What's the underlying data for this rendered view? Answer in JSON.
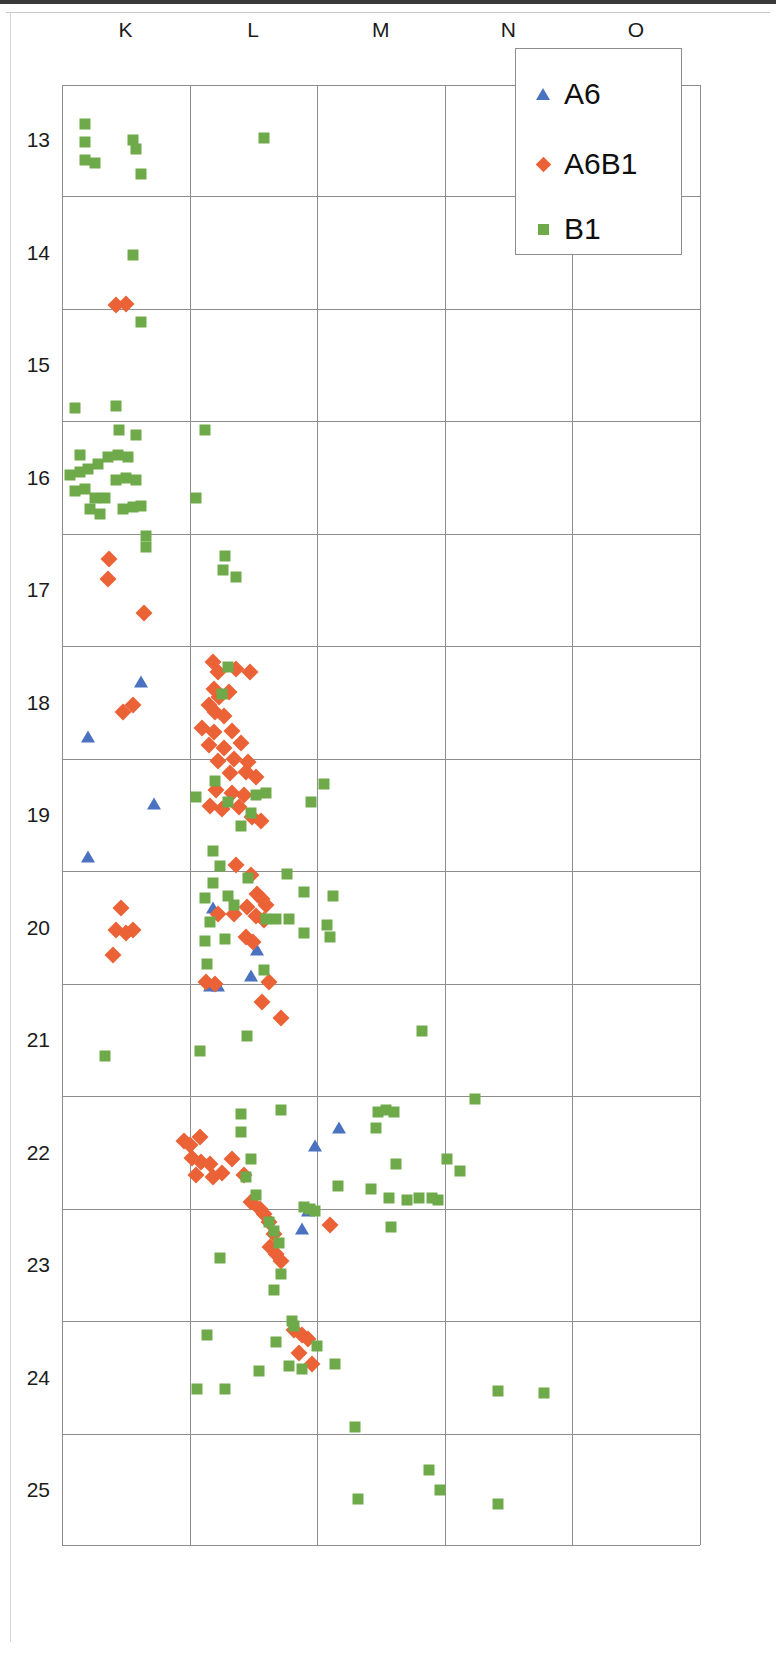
{
  "chart_data": {
    "type": "scatter",
    "title": "",
    "subtitle": "",
    "xlabel": "",
    "ylabel": "",
    "grid": true,
    "legend_position": "top-right",
    "x_tick_labels": [
      "K",
      "L",
      "M",
      "N",
      "O"
    ],
    "y_tick_labels": [
      "13",
      "14",
      "15",
      "16",
      "17",
      "18",
      "19",
      "20",
      "21",
      "22",
      "23",
      "24",
      "25"
    ],
    "y_axis_inverted": true,
    "ylim": [
      12.5,
      25.5
    ],
    "xlim": [
      0,
      5
    ],
    "legend": [
      {
        "name": "A6",
        "marker": "triangle",
        "color": "#4a72c0"
      },
      {
        "name": "A6B1",
        "marker": "diamond",
        "color": "#ec6237"
      },
      {
        "name": "B1",
        "marker": "square",
        "color": "#6faa4a"
      }
    ],
    "series": [
      {
        "name": "A6",
        "marker": "triangle",
        "color": "#4a72c0",
        "points": [
          [
            0.62,
            17.82
          ],
          [
            0.2,
            18.31
          ],
          [
            0.72,
            18.9
          ],
          [
            0.2,
            19.37
          ],
          [
            1.18,
            19.83
          ],
          [
            1.53,
            20.2
          ],
          [
            1.48,
            20.43
          ],
          [
            1.22,
            20.52
          ],
          [
            1.16,
            20.52
          ],
          [
            2.17,
            21.78
          ],
          [
            1.98,
            21.94
          ],
          [
            1.93,
            22.52
          ],
          [
            1.88,
            22.68
          ]
        ]
      },
      {
        "name": "A6B1",
        "marker": "diamond",
        "color": "#ec6237",
        "points": [
          [
            0.42,
            14.47
          ],
          [
            0.5,
            14.46
          ],
          [
            0.37,
            16.72
          ],
          [
            0.36,
            16.9
          ],
          [
            0.64,
            17.2
          ],
          [
            0.56,
            18.02
          ],
          [
            0.48,
            18.08
          ],
          [
            1.18,
            17.64
          ],
          [
            1.22,
            17.73
          ],
          [
            1.36,
            17.7
          ],
          [
            1.47,
            17.73
          ],
          [
            1.19,
            17.88
          ],
          [
            1.23,
            17.95
          ],
          [
            1.31,
            17.91
          ],
          [
            1.15,
            18.02
          ],
          [
            1.2,
            18.08
          ],
          [
            1.27,
            18.12
          ],
          [
            1.1,
            18.23
          ],
          [
            1.19,
            18.26
          ],
          [
            1.33,
            18.25
          ],
          [
            1.15,
            18.38
          ],
          [
            1.27,
            18.4
          ],
          [
            1.4,
            18.36
          ],
          [
            1.22,
            18.52
          ],
          [
            1.35,
            18.5
          ],
          [
            1.46,
            18.53
          ],
          [
            1.32,
            18.63
          ],
          [
            1.44,
            18.62
          ],
          [
            1.52,
            18.66
          ],
          [
            1.21,
            18.78
          ],
          [
            1.33,
            18.8
          ],
          [
            1.43,
            18.82
          ],
          [
            1.16,
            18.92
          ],
          [
            1.25,
            18.95
          ],
          [
            1.39,
            18.93
          ],
          [
            1.49,
            19.02
          ],
          [
            1.56,
            19.05
          ],
          [
            1.36,
            19.44
          ],
          [
            1.48,
            19.53
          ],
          [
            0.46,
            19.83
          ],
          [
            0.42,
            20.02
          ],
          [
            0.5,
            20.05
          ],
          [
            0.56,
            20.02
          ],
          [
            0.4,
            20.24
          ],
          [
            1.22,
            19.88
          ],
          [
            1.35,
            19.88
          ],
          [
            1.45,
            19.82
          ],
          [
            1.53,
            19.7
          ],
          [
            1.57,
            19.75
          ],
          [
            1.6,
            19.8
          ],
          [
            1.52,
            19.9
          ],
          [
            1.58,
            19.93
          ],
          [
            1.44,
            20.08
          ],
          [
            1.5,
            20.13
          ],
          [
            1.13,
            20.48
          ],
          [
            1.2,
            20.5
          ],
          [
            1.62,
            20.48
          ],
          [
            1.57,
            20.66
          ],
          [
            1.72,
            20.8
          ],
          [
            0.96,
            21.9
          ],
          [
            1.0,
            21.93
          ],
          [
            1.08,
            21.86
          ],
          [
            1.02,
            22.05
          ],
          [
            1.09,
            22.08
          ],
          [
            1.16,
            22.1
          ],
          [
            1.05,
            22.2
          ],
          [
            1.18,
            22.22
          ],
          [
            1.25,
            22.18
          ],
          [
            1.33,
            22.06
          ],
          [
            1.43,
            22.2
          ],
          [
            1.48,
            22.44
          ],
          [
            1.55,
            22.5
          ],
          [
            1.58,
            22.55
          ],
          [
            1.62,
            22.62
          ],
          [
            1.66,
            22.72
          ],
          [
            1.63,
            22.84
          ],
          [
            1.68,
            22.9
          ],
          [
            1.72,
            22.96
          ],
          [
            2.1,
            22.64
          ],
          [
            1.82,
            23.58
          ],
          [
            1.88,
            23.62
          ],
          [
            1.93,
            23.66
          ],
          [
            1.86,
            23.78
          ],
          [
            1.96,
            23.88
          ]
        ]
      },
      {
        "name": "B1",
        "marker": "square",
        "color": "#6faa4a",
        "points": [
          [
            0.18,
            12.86
          ],
          [
            0.18,
            13.02
          ],
          [
            0.18,
            13.18
          ],
          [
            0.26,
            13.2
          ],
          [
            0.56,
            13.0
          ],
          [
            0.58,
            13.08
          ],
          [
            0.62,
            13.3
          ],
          [
            1.58,
            12.98
          ],
          [
            0.56,
            14.02
          ],
          [
            0.62,
            14.62
          ],
          [
            0.1,
            15.38
          ],
          [
            0.42,
            15.36
          ],
          [
            0.45,
            15.58
          ],
          [
            0.58,
            15.62
          ],
          [
            1.12,
            15.58
          ],
          [
            0.14,
            15.8
          ],
          [
            0.06,
            15.98
          ],
          [
            0.14,
            15.95
          ],
          [
            0.2,
            15.92
          ],
          [
            0.28,
            15.88
          ],
          [
            0.36,
            15.82
          ],
          [
            0.44,
            15.8
          ],
          [
            0.52,
            15.82
          ],
          [
            0.1,
            16.12
          ],
          [
            0.18,
            16.1
          ],
          [
            0.26,
            16.18
          ],
          [
            0.34,
            16.18
          ],
          [
            0.42,
            16.02
          ],
          [
            0.5,
            16.0
          ],
          [
            0.58,
            16.02
          ],
          [
            0.22,
            16.28
          ],
          [
            0.3,
            16.32
          ],
          [
            0.48,
            16.28
          ],
          [
            0.56,
            16.26
          ],
          [
            0.62,
            16.25
          ],
          [
            1.05,
            16.18
          ],
          [
            0.66,
            16.52
          ],
          [
            0.66,
            16.62
          ],
          [
            1.28,
            16.7
          ],
          [
            1.26,
            16.82
          ],
          [
            1.36,
            16.88
          ],
          [
            1.3,
            17.68
          ],
          [
            1.25,
            17.92
          ],
          [
            1.2,
            18.7
          ],
          [
            1.05,
            18.84
          ],
          [
            1.3,
            18.88
          ],
          [
            1.52,
            18.82
          ],
          [
            1.6,
            18.8
          ],
          [
            1.48,
            18.98
          ],
          [
            2.05,
            18.72
          ],
          [
            1.95,
            18.88
          ],
          [
            1.4,
            19.1
          ],
          [
            1.18,
            19.32
          ],
          [
            1.24,
            19.45
          ],
          [
            1.18,
            19.6
          ],
          [
            1.46,
            19.56
          ],
          [
            1.76,
            19.52
          ],
          [
            1.12,
            19.74
          ],
          [
            1.3,
            19.72
          ],
          [
            1.35,
            19.8
          ],
          [
            1.9,
            19.68
          ],
          [
            2.12,
            19.72
          ],
          [
            1.16,
            19.95
          ],
          [
            1.6,
            19.92
          ],
          [
            1.68,
            19.92
          ],
          [
            1.78,
            19.92
          ],
          [
            2.08,
            19.98
          ],
          [
            2.1,
            20.08
          ],
          [
            1.12,
            20.12
          ],
          [
            1.28,
            20.1
          ],
          [
            1.9,
            20.05
          ],
          [
            1.14,
            20.32
          ],
          [
            1.58,
            20.38
          ],
          [
            0.34,
            21.14
          ],
          [
            1.08,
            21.1
          ],
          [
            1.45,
            20.96
          ],
          [
            2.82,
            20.92
          ],
          [
            1.4,
            21.66
          ],
          [
            1.72,
            21.62
          ],
          [
            1.4,
            21.82
          ],
          [
            2.48,
            21.64
          ],
          [
            2.54,
            21.62
          ],
          [
            2.6,
            21.64
          ],
          [
            2.46,
            21.78
          ],
          [
            3.24,
            21.52
          ],
          [
            1.48,
            22.06
          ],
          [
            1.44,
            22.22
          ],
          [
            2.62,
            22.1
          ],
          [
            3.02,
            22.06
          ],
          [
            3.12,
            22.16
          ],
          [
            1.52,
            22.38
          ],
          [
            2.16,
            22.3
          ],
          [
            2.42,
            22.32
          ],
          [
            2.56,
            22.4
          ],
          [
            2.7,
            22.42
          ],
          [
            2.8,
            22.4
          ],
          [
            2.9,
            22.4
          ],
          [
            2.95,
            22.42
          ],
          [
            1.9,
            22.48
          ],
          [
            1.94,
            22.5
          ],
          [
            1.98,
            22.52
          ],
          [
            1.62,
            22.62
          ],
          [
            1.66,
            22.7
          ],
          [
            1.7,
            22.8
          ],
          [
            2.58,
            22.66
          ],
          [
            1.24,
            22.94
          ],
          [
            1.72,
            23.08
          ],
          [
            1.66,
            23.22
          ],
          [
            1.8,
            23.5
          ],
          [
            1.82,
            23.54
          ],
          [
            1.14,
            23.62
          ],
          [
            1.68,
            23.68
          ],
          [
            2.0,
            23.72
          ],
          [
            1.54,
            23.94
          ],
          [
            1.78,
            23.9
          ],
          [
            1.88,
            23.92
          ],
          [
            2.14,
            23.88
          ],
          [
            1.06,
            24.1
          ],
          [
            1.28,
            24.1
          ],
          [
            3.42,
            24.12
          ],
          [
            3.78,
            24.14
          ],
          [
            2.3,
            24.44
          ],
          [
            2.88,
            24.82
          ],
          [
            2.96,
            25.0
          ],
          [
            2.32,
            25.08
          ],
          [
            3.42,
            25.12
          ]
        ]
      }
    ]
  },
  "legend_box": {
    "entries": [
      "A6",
      "A6B1",
      "B1"
    ]
  }
}
